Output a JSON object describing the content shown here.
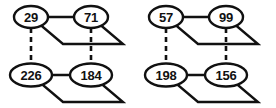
{
  "figure": {
    "background_color": "#ffffff",
    "stroke_color": "#111111",
    "node_fill_color": "#ffffff",
    "width": 276,
    "height": 108
  },
  "diagrams": [
    {
      "name": "left-diagram",
      "nodes": {
        "top_left": "29",
        "top_right": "71",
        "bottom_left": "226",
        "bottom_right": "184"
      },
      "dashed_links": [
        {
          "from": "29",
          "to": "226"
        },
        {
          "from": "71",
          "to": "184"
        }
      ],
      "solid_links": [
        {
          "from": "29",
          "to": "71"
        },
        {
          "from": "226",
          "to": "184"
        }
      ]
    },
    {
      "name": "right-diagram",
      "nodes": {
        "top_left": "57",
        "top_right": "99",
        "bottom_left": "198",
        "bottom_right": "156"
      },
      "dashed_links": [
        {
          "from": "57",
          "to": "198"
        },
        {
          "from": "99",
          "to": "156"
        }
      ],
      "solid_links": [
        {
          "from": "57",
          "to": "99"
        },
        {
          "from": "198",
          "to": "156"
        }
      ]
    }
  ]
}
